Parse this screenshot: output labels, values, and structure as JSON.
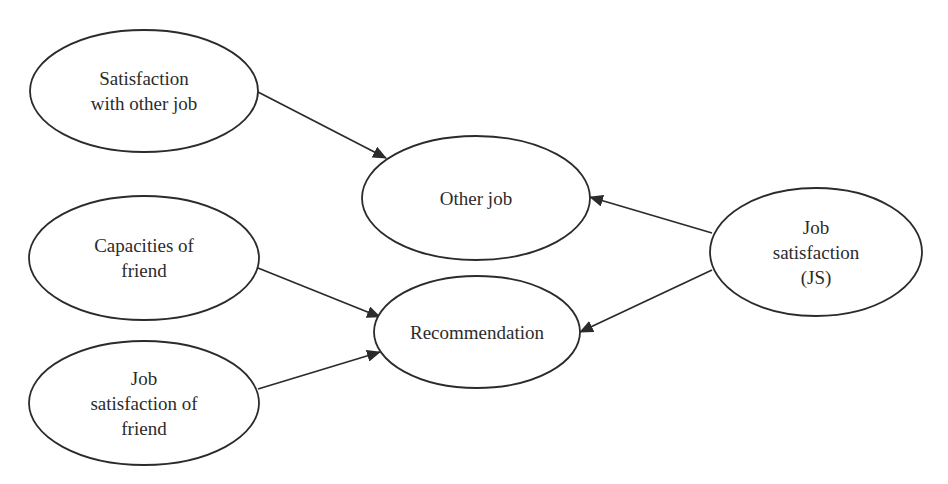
{
  "diagram": {
    "type": "path-model",
    "nodes": [
      {
        "id": "satisfaction_other_job",
        "label": "Satisfaction\nwith other job",
        "cx": 144,
        "cy": 91,
        "rx": 114,
        "ry": 61
      },
      {
        "id": "other_job",
        "label": "Other job",
        "cx": 476,
        "cy": 198,
        "rx": 114,
        "ry": 62
      },
      {
        "id": "capacities_friend",
        "label": "Capacities of\nfriend",
        "cx": 144,
        "cy": 258,
        "rx": 115,
        "ry": 62
      },
      {
        "id": "recommendation",
        "label": "Recommendation",
        "cx": 477,
        "cy": 332,
        "rx": 103,
        "ry": 56
      },
      {
        "id": "job_satisfaction_friend",
        "label": "Job\nsatisfaction of\nfriend",
        "cx": 144,
        "cy": 403,
        "rx": 115,
        "ry": 62
      },
      {
        "id": "job_satisfaction",
        "label": "Job\nsatisfaction\n(JS)",
        "cx": 816,
        "cy": 252,
        "rx": 106,
        "ry": 64
      }
    ],
    "edges": [
      {
        "from": "satisfaction_other_job",
        "to": "other_job",
        "x1": 258,
        "y1": 92,
        "x2": 386,
        "y2": 158
      },
      {
        "from": "job_satisfaction",
        "to": "other_job",
        "x1": 712,
        "y1": 233,
        "x2": 590,
        "y2": 197
      },
      {
        "from": "capacities_friend",
        "to": "recommendation",
        "x1": 258,
        "y1": 268,
        "x2": 380,
        "y2": 317
      },
      {
        "from": "job_satisfaction_friend",
        "to": "recommendation",
        "x1": 258,
        "y1": 389,
        "x2": 380,
        "y2": 352
      },
      {
        "from": "job_satisfaction",
        "to": "recommendation",
        "x1": 712,
        "y1": 270,
        "x2": 580,
        "y2": 332
      }
    ],
    "colors": {
      "stroke": "#2b2b2b",
      "fill": "#ffffff",
      "text": "#2b2b2b"
    }
  }
}
